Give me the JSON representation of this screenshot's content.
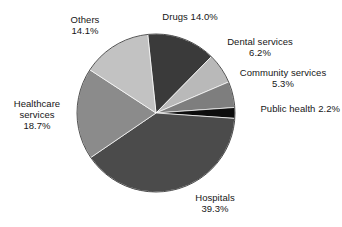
{
  "chart_data": {
    "type": "pie",
    "title": "",
    "subtitle": "",
    "xlabel": "",
    "ylabel": "",
    "legend_position": "none",
    "grid": false,
    "units": "percent",
    "start_angle_deg": -6,
    "direction": "clockwise",
    "categories": [
      "Drugs",
      "Dental services",
      "Community services",
      "Public health",
      "Hospitals",
      "Healthcare services",
      "Others"
    ],
    "values": [
      14.0,
      6.2,
      5.3,
      2.2,
      39.3,
      18.7,
      14.1
    ],
    "slices": [
      {
        "name": "Drugs",
        "value": 14.0,
        "value_text": "14.0%",
        "color": "#3a3a3a",
        "label_lines": [
          "Drugs 14.0%"
        ],
        "label_align": "center"
      },
      {
        "name": "Dental services",
        "value": 6.2,
        "value_text": "6.2%",
        "color": "#b9b9b9",
        "label_lines": [
          "Dental services",
          "6.2%"
        ],
        "label_align": "center"
      },
      {
        "name": "Community services",
        "value": 5.3,
        "value_text": "5.3%",
        "color": "#7e7e7e",
        "label_lines": [
          "Community services",
          "5.3%"
        ],
        "label_align": "center"
      },
      {
        "name": "Public health",
        "value": 2.2,
        "value_text": "2.2%",
        "color": "#0d0d0d",
        "label_lines": [
          "Public health 2.2%"
        ],
        "label_align": "right"
      },
      {
        "name": "Hospitals",
        "value": 39.3,
        "value_text": "39.3%",
        "color": "#4b4b4b",
        "label_lines": [
          "Hospitals",
          "39.3%"
        ],
        "label_align": "center"
      },
      {
        "name": "Healthcare services",
        "value": 18.7,
        "value_text": "18.7%",
        "color": "#8b8b8b",
        "label_lines": [
          "Healthcare",
          "services",
          "18.7%"
        ],
        "label_align": "center"
      },
      {
        "name": "Others",
        "value": 14.1,
        "value_text": "14.1%",
        "color": "#c2c2c2",
        "label_lines": [
          "Others",
          "14.1%"
        ],
        "label_align": "center"
      }
    ],
    "labels": {
      "drugs": {
        "line1": "Drugs 14.0%"
      },
      "dental": {
        "line1": "Dental services",
        "line2": "6.2%"
      },
      "community": {
        "line1": "Community services",
        "line2": "5.3%"
      },
      "public_health": {
        "line1": "Public health 2.2%"
      },
      "hospitals": {
        "line1": "Hospitals",
        "line2": "39.3%"
      },
      "healthcare": {
        "line1": "Healthcare",
        "line2": "services",
        "line3": "18.7%"
      },
      "others": {
        "line1": "Others",
        "line2": "14.1%"
      }
    },
    "geometry": {
      "center_x": 156,
      "center_y": 113,
      "radius": 79
    },
    "colors": {
      "background": "#ffffff",
      "text": "#161616",
      "outline": "#2a2a2a"
    }
  }
}
